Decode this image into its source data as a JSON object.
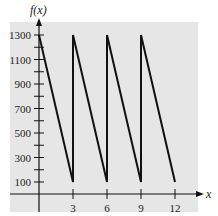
{
  "chart_data": {
    "type": "line",
    "title": "",
    "xlabel": "x",
    "ylabel": "f(x)",
    "x_ticks": [
      3,
      6,
      9,
      12
    ],
    "y_ticks_labeled": [
      100,
      300,
      500,
      700,
      900,
      1100,
      1300
    ],
    "y_ticks_minor": [
      200,
      400,
      600,
      800,
      1000,
      1200
    ],
    "xlim": [
      -1,
      14
    ],
    "ylim": [
      0,
      1400
    ],
    "grid": false,
    "series": [
      {
        "name": "f(x)",
        "points": [
          [
            0,
            1300
          ],
          [
            3,
            100
          ],
          [
            3,
            1300
          ],
          [
            6,
            100
          ],
          [
            6,
            1300
          ],
          [
            9,
            100
          ],
          [
            9,
            1300
          ],
          [
            12,
            100
          ]
        ]
      }
    ],
    "background": "#e8e8e8",
    "line_color": "#111111"
  },
  "labels": {
    "y_axis_title": "f(x)",
    "x_axis_title": "x"
  }
}
